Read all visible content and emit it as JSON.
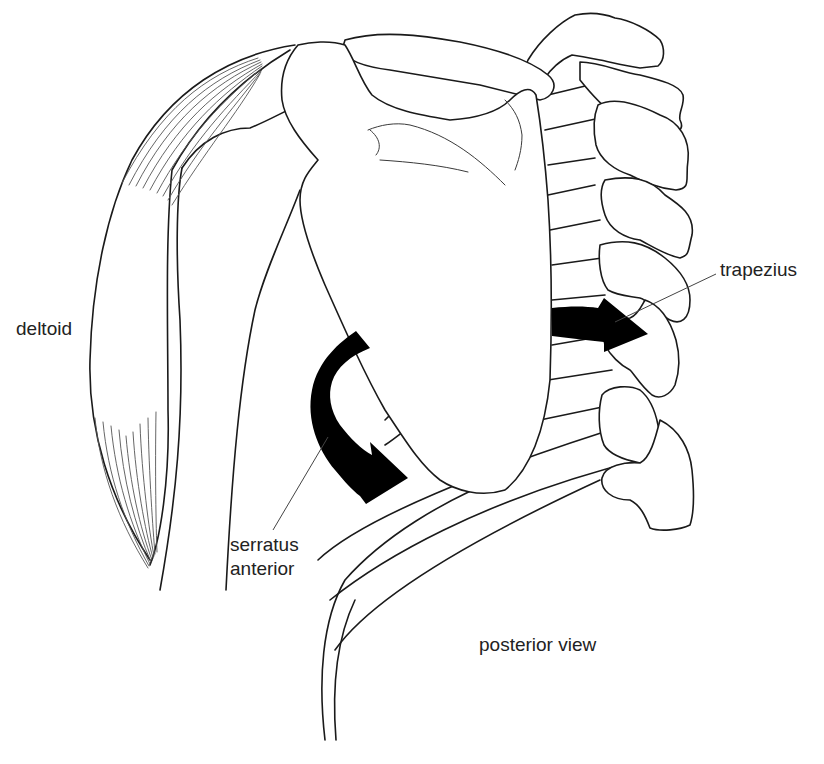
{
  "figure": {
    "view_label": "posterior view",
    "colors": {
      "line": "#1a1a1a",
      "arrow": "#000000",
      "background": "#ffffff"
    }
  },
  "labels": {
    "deltoid": "deltoid",
    "trapezius": "trapezius",
    "serratus_line1": "serratus",
    "serratus_line2": "anterior",
    "posterior_view": "posterior view"
  },
  "arrows": [
    {
      "name": "trapezius-arrow",
      "direction": "medial (toward spine)"
    },
    {
      "name": "serratus-anterior-arrow",
      "direction": "curved, around lateral border of scapula, forward"
    }
  ]
}
